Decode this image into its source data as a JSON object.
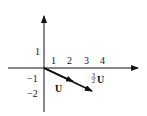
{
  "diagram": {
    "x_tick_labels": [
      "1",
      "2",
      "3",
      "4"
    ],
    "y_tick_labels": [
      "1",
      "−1",
      "−2"
    ],
    "vectors": [
      {
        "name": "U",
        "label": "U",
        "from": [
          0,
          0
        ],
        "to": [
          2,
          -1
        ]
      },
      {
        "name": "three_halves_U",
        "label": "U",
        "coefficient_num": "3",
        "coefficient_den": "2",
        "from": [
          0,
          0
        ],
        "to": [
          3,
          -1.5
        ]
      }
    ]
  }
}
